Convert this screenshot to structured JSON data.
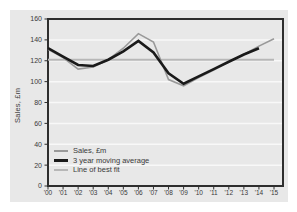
{
  "window": {
    "background": "#ffffff"
  },
  "panel": {
    "background": "#e8e8e8",
    "frame_color": "#2e2e2e",
    "grid_color": "#f8f8f8",
    "text_color": "#3a3a3a",
    "tick_color": "#2e2e2e"
  },
  "chart_data": {
    "type": "line",
    "title": "",
    "xlabel": "",
    "ylabel": "Sales, £m",
    "ylim": [
      0,
      160
    ],
    "ytick_step": 20,
    "y_tick_labels": [
      "0",
      "20",
      "40",
      "60",
      "80",
      "100",
      "120",
      "140",
      "160"
    ],
    "grid": "horizontal light gridlines on gray panel",
    "legend_position": "inside-bottom-left",
    "categories": [
      "'00",
      "'01",
      "'02",
      "'03",
      "'04",
      "'05",
      "'06",
      "'07",
      "'08",
      "'09",
      "'10",
      "'11",
      "'12",
      "'13",
      "'14",
      "'15"
    ],
    "series": [
      {
        "name": "Sales, £m",
        "color": "#999999",
        "thickness": 1.6,
        "values": [
          131,
          123,
          112,
          114,
          121,
          132,
          146,
          138,
          102,
          96,
          104,
          111,
          119,
          126,
          134,
          141
        ]
      },
      {
        "name": "3 year moving average",
        "color": "#1a1a1a",
        "thickness": 2.6,
        "values": [
          132,
          124,
          116,
          115,
          121,
          129,
          139,
          128,
          108,
          98,
          105,
          112,
          119,
          126,
          132,
          null
        ]
      },
      {
        "name": "Line of best fit",
        "color": "#b7b7b7",
        "thickness": 2,
        "values": [
          121,
          121,
          121,
          121,
          121,
          121,
          121,
          121,
          121,
          121,
          121,
          121,
          121,
          121,
          121,
          121
        ]
      }
    ]
  }
}
